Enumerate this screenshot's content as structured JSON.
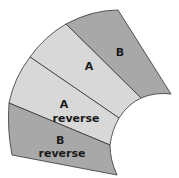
{
  "diagram": {
    "type": "annular-sector-bands",
    "colors": {
      "band_b": "#a8a8a8",
      "band_a": "#d8d8d8",
      "stroke": "#333333"
    },
    "bands": [
      {
        "id": "b",
        "label_lines": [
          "B"
        ]
      },
      {
        "id": "a",
        "label_lines": [
          "A"
        ]
      },
      {
        "id": "a-reverse",
        "label_lines": [
          "A",
          "reverse"
        ]
      },
      {
        "id": "b-reverse",
        "label_lines": [
          "B",
          "reverse"
        ]
      }
    ]
  }
}
